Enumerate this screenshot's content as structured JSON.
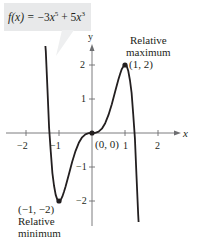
{
  "function_label": {
    "prefix": "f(x) = ",
    "text": "f(x) = −3x⁵ + 5x³",
    "term1_coef": "−3",
    "term1_var": "x",
    "term1_exp": "5",
    "op": "+",
    "term2_coef": "5",
    "term2_var": "x",
    "term2_exp": "3"
  },
  "axes": {
    "x_label": "x",
    "y_label": "y",
    "x_ticks": [
      "−2",
      "−1",
      "1",
      "2"
    ],
    "y_ticks": [
      "2",
      "1",
      "−1",
      "−2"
    ]
  },
  "annotations": {
    "max": {
      "line1": "Relative",
      "line2": "maximum",
      "point": "(1, 2)"
    },
    "origin": {
      "point": "(0, 0)"
    },
    "min": {
      "point": "(−1, −2)",
      "line1": "Relative",
      "line2": "minimum"
    }
  },
  "colors": {
    "curve": "#231f20",
    "axis": "#6d6e71",
    "label_box": "#e8e9ea"
  }
}
